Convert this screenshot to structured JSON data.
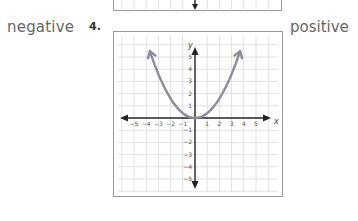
{
  "left_label": "negative",
  "problem_number": "4.",
  "right_label": "positive",
  "chart_data": {
    "type": "line",
    "title": "",
    "function": "y = 0.4x^2 (upward-opening parabola, vertex at origin)",
    "series": [
      {
        "name": "parabola",
        "color": "#8f8a98",
        "x": [
          -3.7,
          -3,
          -2,
          -1,
          0,
          1,
          2,
          3,
          3.7
        ],
        "y": [
          5.5,
          3.6,
          1.6,
          0.4,
          0,
          0.4,
          1.6,
          3.6,
          5.5
        ]
      }
    ],
    "xlabel": "x",
    "ylabel": "y",
    "xticks": [
      "-5",
      "-4",
      "-3",
      "-2",
      "-1",
      "1",
      "2",
      "3",
      "4",
      "5"
    ],
    "yticks": [
      "5",
      "4",
      "3",
      "2",
      "1",
      "-1",
      "-2",
      "-3",
      "-4",
      "-5"
    ],
    "xlim": [
      -6,
      6
    ],
    "ylim": [
      -6,
      6
    ],
    "grid": true,
    "legend": "none"
  }
}
